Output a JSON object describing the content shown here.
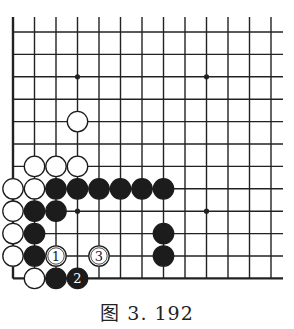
{
  "diagram": {
    "caption": "图 3. 192",
    "board": {
      "columns": 13,
      "rows": 12,
      "origin_x": 13,
      "origin_y": 32,
      "col_spacing": 21.5,
      "row_spacing": 22.4,
      "line_top": 17,
      "line_right": 283,
      "left_edge": true,
      "bottom_edge": true,
      "line_color": "#222222",
      "star_points": [
        [
          3,
          2
        ],
        [
          9,
          2
        ],
        [
          3,
          8
        ],
        [
          9,
          8
        ]
      ]
    },
    "stones": [
      {
        "color": "white",
        "col": 3,
        "row": 4,
        "label": ""
      },
      {
        "color": "white",
        "col": 1,
        "row": 6,
        "label": ""
      },
      {
        "color": "white",
        "col": 2,
        "row": 6,
        "label": ""
      },
      {
        "color": "white",
        "col": 3,
        "row": 6,
        "label": ""
      },
      {
        "color": "white",
        "col": 0,
        "row": 7,
        "label": ""
      },
      {
        "color": "white",
        "col": 1,
        "row": 7,
        "label": ""
      },
      {
        "color": "black",
        "col": 2,
        "row": 7,
        "label": ""
      },
      {
        "color": "black",
        "col": 3,
        "row": 7,
        "label": ""
      },
      {
        "color": "black",
        "col": 4,
        "row": 7,
        "label": ""
      },
      {
        "color": "black",
        "col": 5,
        "row": 7,
        "label": ""
      },
      {
        "color": "black",
        "col": 6,
        "row": 7,
        "label": ""
      },
      {
        "color": "black",
        "col": 7,
        "row": 7,
        "label": ""
      },
      {
        "color": "white",
        "col": 0,
        "row": 8,
        "label": ""
      },
      {
        "color": "black",
        "col": 1,
        "row": 8,
        "label": ""
      },
      {
        "color": "black",
        "col": 2,
        "row": 8,
        "label": ""
      },
      {
        "color": "white",
        "col": 0,
        "row": 9,
        "label": ""
      },
      {
        "color": "black",
        "col": 1,
        "row": 9,
        "label": ""
      },
      {
        "color": "black",
        "col": 7,
        "row": 9,
        "label": ""
      },
      {
        "color": "white",
        "col": 0,
        "row": 10,
        "label": ""
      },
      {
        "color": "black",
        "col": 1,
        "row": 10,
        "label": ""
      },
      {
        "color": "white",
        "col": 2,
        "row": 10,
        "label": "1"
      },
      {
        "color": "white",
        "col": 4,
        "row": 10,
        "label": "3"
      },
      {
        "color": "black",
        "col": 7,
        "row": 10,
        "label": ""
      },
      {
        "color": "white",
        "col": 1,
        "row": 11,
        "label": ""
      },
      {
        "color": "black",
        "col": 2,
        "row": 11,
        "label": ""
      },
      {
        "color": "black",
        "col": 3,
        "row": 11,
        "label": "2"
      }
    ]
  }
}
